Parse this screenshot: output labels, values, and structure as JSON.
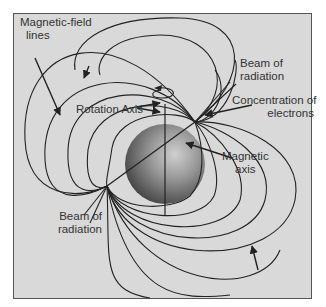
{
  "diagram": {
    "labels": {
      "field_lines": [
        "Magnetic-field",
        "lines"
      ],
      "beam_top": [
        "Beam of",
        "radiation"
      ],
      "rotation_axis": "Rotation Axis",
      "electrons": [
        "Concentration of",
        "electrons"
      ],
      "magnetic_axis": [
        "Magnetic",
        "axis"
      ],
      "beam_bottom": [
        "Beam of",
        "radiation"
      ]
    },
    "colors": {
      "background": "#d9d9d9",
      "line": "#222222",
      "star_light": "#c8c8c8",
      "star_dark": "#505050",
      "text": "#333333"
    }
  }
}
